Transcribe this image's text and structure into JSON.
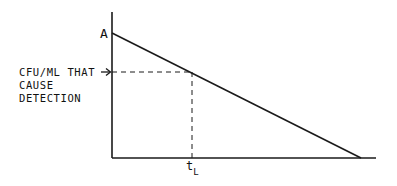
{
  "diagram": {
    "type": "line-graph-schematic",
    "colors": {
      "stroke": "#1a1a1a",
      "background": "#ffffff"
    },
    "y_intercept_label": "A",
    "threshold_label_lines": [
      "CFU/ML THAT",
      "CAUSE",
      "DETECTION"
    ],
    "x_marker_label": {
      "main": "t",
      "subscript": "L"
    },
    "elements": [
      "y-axis",
      "x-axis",
      "declining line from A to x-axis",
      "horizontal dashed line at detection threshold",
      "vertical dashed line down to t_L",
      "arrow pointing to y-axis at threshold"
    ]
  }
}
